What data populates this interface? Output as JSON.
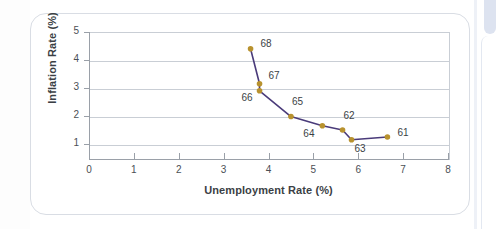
{
  "chart_data": {
    "type": "line",
    "title": "",
    "subtitle": "",
    "xlabel": "Unemployment Rate (%)",
    "ylabel": "Inflation Rate (%)",
    "xlim": [
      0,
      8
    ],
    "ylim": [
      0,
      5
    ],
    "xticks": [
      0,
      1,
      2,
      3,
      4,
      5,
      6,
      7,
      8
    ],
    "yticks": [
      1,
      2,
      3,
      4,
      5
    ],
    "xtick_labels": [
      "0",
      "1",
      "2",
      "3",
      "4",
      "5",
      "6",
      "7",
      "8"
    ],
    "ytick_labels": [
      "1",
      "2",
      "3",
      "4",
      "5"
    ],
    "grid": "horizontal",
    "legend": "none",
    "series": [
      {
        "name": "Phillips curve",
        "line_color": "#4a3b7a",
        "marker_color": "#b8922e",
        "points": [
          {
            "label": "68",
            "x": 3.6,
            "y": 4.4,
            "label_dx": 10,
            "label_dy": -5
          },
          {
            "label": "67",
            "x": 3.8,
            "y": 3.15,
            "label_dx": 9,
            "label_dy": -8
          },
          {
            "label": "66",
            "x": 3.8,
            "y": 2.9,
            "label_dx": -18,
            "label_dy": 7
          },
          {
            "label": "65",
            "x": 4.5,
            "y": 1.98,
            "label_dx": 1,
            "label_dy": -15
          },
          {
            "label": "64",
            "x": 5.2,
            "y": 1.65,
            "label_dx": -19,
            "label_dy": 8
          },
          {
            "label": "62",
            "x": 5.65,
            "y": 1.5,
            "label_dx": 1,
            "label_dy": -14
          },
          {
            "label": "63",
            "x": 5.85,
            "y": 1.15,
            "label_dx": 3,
            "label_dy": 9
          },
          {
            "label": "61",
            "x": 6.65,
            "y": 1.25,
            "label_dx": 10,
            "label_dy": -4
          }
        ],
        "path_order": [
          "68",
          "67",
          "66",
          "65",
          "64",
          "62",
          "63",
          "61"
        ]
      }
    ],
    "colors": {
      "line": "#4a3b7a",
      "marker": "#b8922e",
      "grid": "#c9ced5",
      "axis": "#9aa0a8",
      "text": "#3b3f45",
      "card_border": "#d9dde4",
      "background": "#ffffff"
    }
  }
}
